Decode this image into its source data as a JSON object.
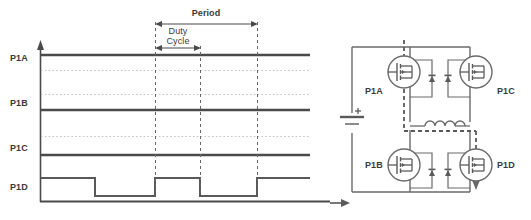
{
  "figure": {
    "colors": {
      "trace": "#4a4a4a",
      "trace_dark": "#3c3c3c",
      "dotted": "#bdbdbd",
      "dashed_marker": "#555555",
      "circuit": "#6a6a6a",
      "text": "#3a3a3a",
      "background": "#ffffff"
    }
  },
  "timing": {
    "annotations": {
      "period_label": "Period",
      "duty_label_line1": "Duty",
      "duty_label_line2": "Cycle"
    },
    "channels": [
      {
        "name": "P1A",
        "label": "P1A",
        "state": "high-constant"
      },
      {
        "name": "P1B",
        "label": "P1B",
        "state": "high-constant"
      },
      {
        "name": "P1C",
        "label": "P1C",
        "state": "high-constant"
      },
      {
        "name": "P1D",
        "label": "P1D",
        "state": "pwm-switching"
      }
    ],
    "waveform_p1d": {
      "description": "Square wave, high then low, repeating",
      "transitions_px": [
        95,
        155,
        200,
        257
      ],
      "start_level": "high",
      "levels": [
        "high",
        "low",
        "high",
        "low",
        "high"
      ]
    },
    "markers": {
      "duty_cycle_start_px": 155,
      "duty_cycle_end_px": 200,
      "period_start_px": 155,
      "period_end_px": 257
    }
  },
  "circuit": {
    "source": {
      "name": "dc-source",
      "polarity_label": "+"
    },
    "inductor": {
      "name": "load-inductor",
      "coil_turns": 4
    },
    "current_path": {
      "style": "dashed",
      "arrow_direction": "down"
    },
    "mosfets": [
      {
        "id": "P1A",
        "label": "P1A",
        "position": "top-left",
        "label_side": "left"
      },
      {
        "id": "P1C",
        "label": "P1C",
        "position": "top-right",
        "label_side": "right"
      },
      {
        "id": "P1B",
        "label": "P1B",
        "position": "bottom-left",
        "label_side": "left"
      },
      {
        "id": "P1D",
        "label": "P1D",
        "position": "bottom-right",
        "label_side": "right"
      }
    ],
    "diodes": [
      {
        "name": "body-diode-p1a"
      },
      {
        "name": "body-diode-p1c"
      },
      {
        "name": "body-diode-p1b"
      },
      {
        "name": "body-diode-p1d"
      }
    ]
  }
}
